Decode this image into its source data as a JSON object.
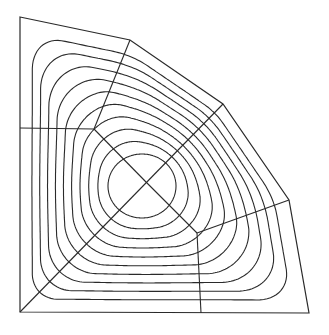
{
  "diagram": {
    "stroke_color": "#2a2a2a",
    "background": "#ffffff",
    "boundary_polygon": [
      [
        20,
        17
      ],
      [
        130,
        40
      ],
      [
        223,
        104
      ],
      [
        289,
        200
      ],
      [
        309,
        313
      ],
      [
        20,
        312
      ]
    ],
    "center": [
      146,
      182
    ],
    "mesh_nodes": {
      "center": [
        146,
        182
      ],
      "left_inner": [
        94,
        129
      ],
      "lower_right_inner": [
        197,
        233
      ]
    },
    "mesh_lines": [
      [
        [
          20,
          128
        ],
        [
          94,
          129
        ]
      ],
      [
        [
          94,
          129
        ],
        [
          130,
          40
        ]
      ],
      [
        [
          94,
          129
        ],
        [
          146,
          182
        ]
      ],
      [
        [
          20,
          312
        ],
        [
          223,
          104
        ]
      ],
      [
        [
          146,
          182
        ],
        [
          197,
          233
        ]
      ],
      [
        [
          197,
          233
        ],
        [
          289,
          200
        ]
      ],
      [
        [
          197,
          233
        ],
        [
          201,
          313
        ]
      ]
    ],
    "contour_count": 10,
    "innermost_ellipse": {
      "cx": 142,
      "cy": 186,
      "rx": 34,
      "ry": 32
    }
  }
}
